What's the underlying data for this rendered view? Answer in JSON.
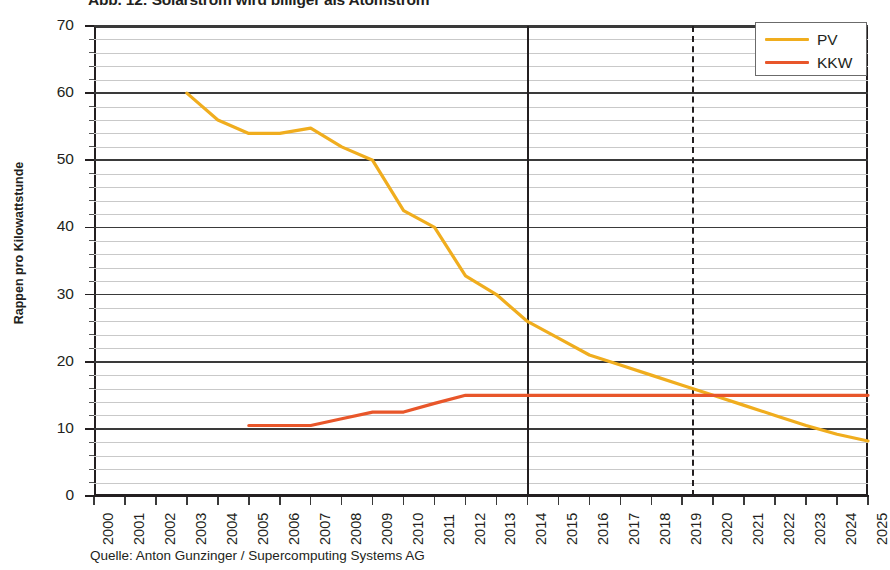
{
  "title": "Abb. 12: Solarstrom wird billiger als Atomstrom",
  "source_note": "Quelle: Anton Gunzinger / Supercomputing Systems AG",
  "axis": {
    "ylabel": "Rappen pro Kilowattstunde",
    "yticks": [
      "0",
      "10",
      "20",
      "30",
      "40",
      "50",
      "60",
      "70"
    ],
    "xticks": [
      "2000",
      "2001",
      "2002",
      "2003",
      "2004",
      "2005",
      "2006",
      "2007",
      "2008",
      "2009",
      "2010",
      "2011",
      "2012",
      "2013",
      "2014",
      "2015",
      "2016",
      "2017",
      "2018",
      "2019",
      "2020",
      "2021",
      "2022",
      "2023",
      "2024",
      "2025"
    ]
  },
  "legend": {
    "position": "top-right",
    "entries": [
      {
        "label": "PV",
        "color": "#f0ad1e"
      },
      {
        "label": "KKW",
        "color": "#e8562a"
      }
    ]
  },
  "markers": {
    "solid_vline_year": 2014,
    "dashed_vline_year": 2019.3
  },
  "chart_data": {
    "type": "line",
    "title": "Abb. 12: Solarstrom wird billiger als Atomstrom",
    "xlabel": "",
    "ylabel": "Rappen pro Kilowattstunde",
    "xlim": [
      2000,
      2025
    ],
    "ylim": [
      0,
      70
    ],
    "grid": true,
    "grid_minor_step": 2,
    "grid_major_step": 10,
    "legend_position": "top-right",
    "annotations": [
      {
        "type": "vline",
        "x": 2014,
        "style": "solid",
        "color": "#231f20"
      },
      {
        "type": "vline",
        "x": 2019.3,
        "style": "dashed",
        "color": "#231f20"
      }
    ],
    "series": [
      {
        "name": "PV",
        "color": "#f0ad1e",
        "x": [
          2003,
          2004,
          2005,
          2006,
          2007,
          2008,
          2009,
          2010,
          2011,
          2012,
          2013,
          2014,
          2015,
          2016,
          2017,
          2018,
          2019,
          2020,
          2021,
          2022,
          2023,
          2024,
          2025
        ],
        "values": [
          60,
          56,
          54,
          54,
          54.8,
          52,
          50,
          42.5,
          40,
          32.8,
          30,
          26,
          23.5,
          21,
          19.5,
          18,
          16.5,
          15,
          13.5,
          12,
          10.5,
          9.2,
          8.2
        ]
      },
      {
        "name": "KKW",
        "color": "#e8562a",
        "x": [
          2005,
          2006,
          2007,
          2008,
          2009,
          2010,
          2011,
          2012,
          2013,
          2014,
          2015,
          2016,
          2017,
          2018,
          2019,
          2020,
          2021,
          2022,
          2023,
          2024,
          2025
        ],
        "values": [
          10.5,
          10.5,
          10.5,
          11.5,
          12.5,
          12.5,
          13.8,
          15,
          15,
          15,
          15,
          15,
          15,
          15,
          15,
          15,
          15,
          15,
          15,
          15,
          15
        ]
      }
    ]
  }
}
